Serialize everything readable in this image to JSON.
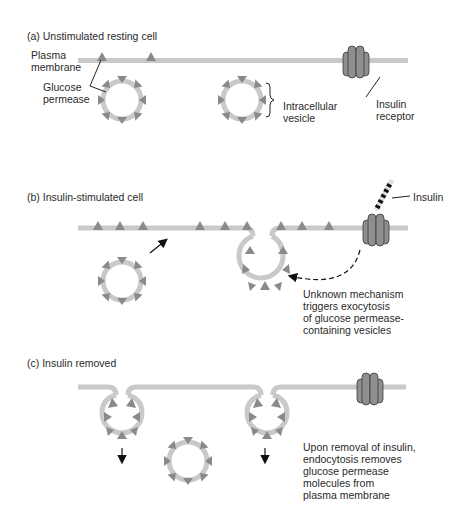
{
  "colors": {
    "membrane": "#c9c9c9",
    "permease": "#8a8a8a",
    "receptor_fill": "#8f8f8f",
    "receptor_stroke": "#3a3a3a",
    "text": "#2a2a2a",
    "arrow": "#111111"
  },
  "panels": [
    {
      "id": "a",
      "title": "(a) Unstimulated resting cell",
      "labels": {
        "plasma_membrane": "Plasma\nmembrane",
        "glucose_permease": "Glucose\npermease",
        "intracellular_vesicle": "Intracellular\nvesicle",
        "insulin_receptor": "Insulin\nreceptor"
      }
    },
    {
      "id": "b",
      "title": "(b) Insulin-stimulated cell",
      "labels": {
        "insulin": "Insulin",
        "note": "Unknown mechanism\ntriggers exocytosis\nof glucose permease-\ncontaining vesicles"
      }
    },
    {
      "id": "c",
      "title": "(c) Insulin removed",
      "labels": {
        "note": "Upon removal of insulin,\nendocytosis removes\nglucose permease\nmolecules from\nplasma membrane"
      }
    }
  ]
}
